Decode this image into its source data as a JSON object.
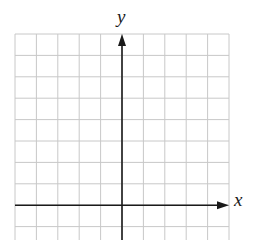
{
  "diagram": {
    "type": "coordinate-grid",
    "x_axis_label": "x",
    "y_axis_label": "y",
    "grid_columns": 10,
    "grid_rows_visible": 10,
    "y_axis_column_index": 5,
    "x_axis_row_index": 8,
    "colors": {
      "grid": "#c8c8c8",
      "axis": "#1a1a1a",
      "background": "#ffffff"
    }
  }
}
